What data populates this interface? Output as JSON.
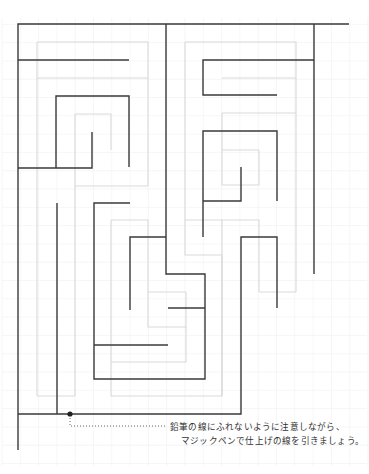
{
  "caption": {
    "line1": "鉛筆の線にふれないように注意しながら、",
    "line2": "マジックペンで仕上げの線を引きましょう。"
  },
  "colors": {
    "ink": "#3a3a3a",
    "guide": "#d9d9d9",
    "grid": "#f0f0f0",
    "background": "#ffffff"
  },
  "grid": {
    "cell": 18.3,
    "x0": 2,
    "y0": 6
  },
  "maze": {
    "ink_lines": [
      [
        [
          349,
          24
        ],
        [
          18,
          24
        ],
        [
          18,
          450
        ]
      ],
      [
        [
          314,
          24
        ],
        [
          314,
          274
        ]
      ],
      [
        [
          18,
          60
        ],
        [
          129,
          60
        ]
      ],
      [
        [
          166,
          24
        ],
        [
          166,
          274
        ],
        [
          205,
          274
        ],
        [
          205,
          379
        ],
        [
          94,
          379
        ],
        [
          94,
          203
        ],
        [
          130,
          203
        ]
      ],
      [
        [
          56,
          168
        ],
        [
          56,
          96
        ],
        [
          129,
          96
        ],
        [
          129,
          167
        ]
      ],
      [
        [
          18,
          168
        ],
        [
          92,
          168
        ],
        [
          92,
          132
        ]
      ],
      [
        [
          57,
          203
        ],
        [
          57,
          414
        ]
      ],
      [
        [
          18,
          414
        ],
        [
          241,
          414
        ],
        [
          241,
          237
        ],
        [
          277,
          237
        ],
        [
          277,
          308
        ]
      ],
      [
        [
          314,
          60
        ],
        [
          203,
          60
        ],
        [
          203,
          95
        ],
        [
          277,
          95
        ]
      ],
      [
        [
          277,
          201
        ],
        [
          277,
          131
        ],
        [
          203,
          131
        ],
        [
          203,
          237
        ]
      ],
      [
        [
          203,
          201
        ],
        [
          241,
          201
        ],
        [
          241,
          167
        ]
      ],
      [
        [
          166,
          237
        ],
        [
          130,
          237
        ],
        [
          130,
          310
        ]
      ],
      [
        [
          168,
          308
        ],
        [
          205,
          308
        ]
      ],
      [
        [
          94,
          345
        ],
        [
          168,
          345
        ]
      ]
    ],
    "guide_lines": [
      [
        [
          37,
          42
        ],
        [
          148,
          42
        ],
        [
          148,
          186
        ]
      ],
      [
        [
          37,
          42
        ],
        [
          37,
          396
        ]
      ],
      [
        [
          37,
          78
        ],
        [
          148,
          78
        ]
      ],
      [
        [
          75,
          114
        ],
        [
          111,
          114
        ],
        [
          111,
          150
        ]
      ],
      [
        [
          75,
          114
        ],
        [
          75,
          186
        ],
        [
          148,
          186
        ]
      ],
      [
        [
          75,
          186
        ],
        [
          75,
          396
        ]
      ],
      [
        [
          111,
          220
        ],
        [
          148,
          220
        ],
        [
          148,
          327
        ],
        [
          186,
          327
        ],
        [
          186,
          292
        ]
      ],
      [
        [
          111,
          220
        ],
        [
          111,
          396
        ],
        [
          222,
          396
        ],
        [
          222,
          220
        ],
        [
          259,
          220
        ],
        [
          259,
          292
        ]
      ],
      [
        [
          37,
          396
        ],
        [
          75,
          396
        ]
      ],
      [
        [
          185,
          42
        ],
        [
          185,
          255
        ],
        [
          222,
          255
        ],
        [
          222,
          396
        ]
      ],
      [
        [
          185,
          42
        ],
        [
          296,
          42
        ],
        [
          296,
          292
        ]
      ],
      [
        [
          222,
          78
        ],
        [
          296,
          78
        ]
      ],
      [
        [
          222,
          113
        ],
        [
          296,
          113
        ]
      ],
      [
        [
          222,
          113
        ],
        [
          222,
          185
        ],
        [
          259,
          185
        ],
        [
          259,
          150
        ]
      ],
      [
        [
          222,
          150
        ],
        [
          259,
          150
        ]
      ],
      [
        [
          185,
          220
        ],
        [
          222,
          220
        ]
      ],
      [
        [
          296,
          292
        ],
        [
          259,
          292
        ]
      ],
      [
        [
          148,
          292
        ],
        [
          186,
          292
        ]
      ],
      [
        [
          111,
          362
        ],
        [
          186,
          362
        ],
        [
          186,
          327
        ]
      ]
    ],
    "start_dot": {
      "x": 70,
      "y": 414
    },
    "leader": {
      "x1": 70,
      "y1": 418,
      "y_line": 426,
      "x2": 167
    }
  }
}
